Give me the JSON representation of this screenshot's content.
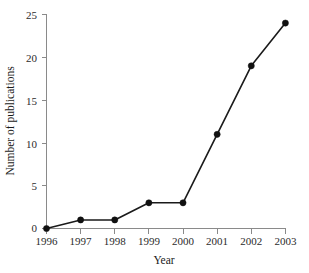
{
  "chart_data": {
    "type": "line",
    "title": "",
    "subtitle": "",
    "xlabel": "Year",
    "ylabel": "Number of publications",
    "categories": [
      "1996",
      "1997",
      "1998",
      "1999",
      "2000",
      "2001",
      "2002",
      "2003"
    ],
    "x": [
      1996,
      1997,
      1998,
      1999,
      2000,
      2001,
      2002,
      2003
    ],
    "values": [
      0,
      1,
      1,
      3,
      3,
      11,
      19,
      24
    ],
    "series": [
      {
        "name": "Number of publications",
        "values": [
          0,
          1,
          1,
          3,
          3,
          11,
          19,
          24
        ]
      }
    ],
    "xtick_labels": [
      "1996",
      "1997",
      "1998",
      "1999",
      "2000",
      "2001",
      "2002",
      "2003"
    ],
    "ytick_labels": [
      "0",
      "5",
      "10",
      "15",
      "20",
      "25"
    ],
    "ytick_values": [
      0,
      5,
      10,
      15,
      20,
      25
    ],
    "ylim": [
      0,
      25
    ],
    "xlim": [
      1996,
      2003
    ],
    "grid": false,
    "legend": false,
    "legend_position": "none",
    "annotations": [],
    "marker": "filled-circle",
    "line_color": "#1a1a1a",
    "marker_color": "#111111",
    "axis_color": "#8a8a8a",
    "background_color": "#ffffff"
  },
  "axis": {
    "y_title": "Number of publications",
    "x_title": "Year"
  },
  "ytick_labels": {
    "t0": "0",
    "t1": "5",
    "t2": "10",
    "t3": "15",
    "t4": "20",
    "t5": "25"
  },
  "xtick_labels": {
    "t0": "1996",
    "t1": "1997",
    "t2": "1998",
    "t3": "1999",
    "t4": "2000",
    "t5": "2001",
    "t6": "2002",
    "t7": "2003"
  }
}
